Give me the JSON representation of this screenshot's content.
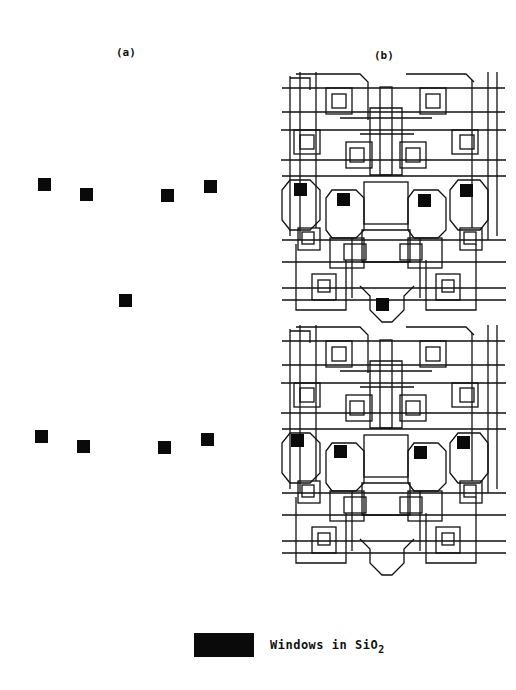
{
  "panels": {
    "a": {
      "label": "(a)"
    },
    "b": {
      "label": "(b)"
    }
  },
  "legend": {
    "text": "Windows in SiO",
    "subscript": "2",
    "swatch_color": "#0a0a0a"
  },
  "panel_a_windows": [
    {
      "x": 38,
      "y": 178
    },
    {
      "x": 80,
      "y": 188
    },
    {
      "x": 161,
      "y": 189
    },
    {
      "x": 204,
      "y": 180
    },
    {
      "x": 119,
      "y": 294
    },
    {
      "x": 35,
      "y": 430
    },
    {
      "x": 77,
      "y": 440
    },
    {
      "x": 158,
      "y": 441
    },
    {
      "x": 201,
      "y": 433
    }
  ],
  "colors": {
    "ink": "#111111",
    "background": "#ffffff"
  }
}
